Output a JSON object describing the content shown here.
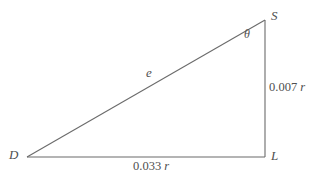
{
  "figure": {
    "type": "geometry-diagram",
    "background_color": "#ffffff",
    "stroke_color": "#6b6b6b",
    "text_color": "#4f4f4f",
    "vertices": [
      {
        "name": "D",
        "label": "D",
        "x": 27,
        "y": 157
      },
      {
        "name": "L",
        "label": "L",
        "x": 265,
        "y": 157
      },
      {
        "name": "S",
        "label": "S",
        "x": 265,
        "y": 20
      }
    ],
    "sides": [
      {
        "name": "hypotenuse-DS",
        "label": "e",
        "from": "D",
        "to": "S"
      },
      {
        "name": "vertical-LS",
        "label": "0.007 r",
        "value": "0.007",
        "unit": "r",
        "from": "L",
        "to": "S"
      },
      {
        "name": "base-DL",
        "label": "0.033 r",
        "value": "0.033",
        "unit": "r",
        "from": "D",
        "to": "L"
      }
    ],
    "angles": [
      {
        "name": "angle-at-S",
        "label": "θ",
        "at_vertex": "S"
      }
    ],
    "labels": {
      "vertex_S": "S",
      "vertex_D": "D",
      "vertex_L": "L",
      "side_e": "e",
      "angle_theta": "θ",
      "right_value": "0.007",
      "right_unit": "r",
      "base_value": "0.033",
      "base_unit": "r"
    }
  }
}
